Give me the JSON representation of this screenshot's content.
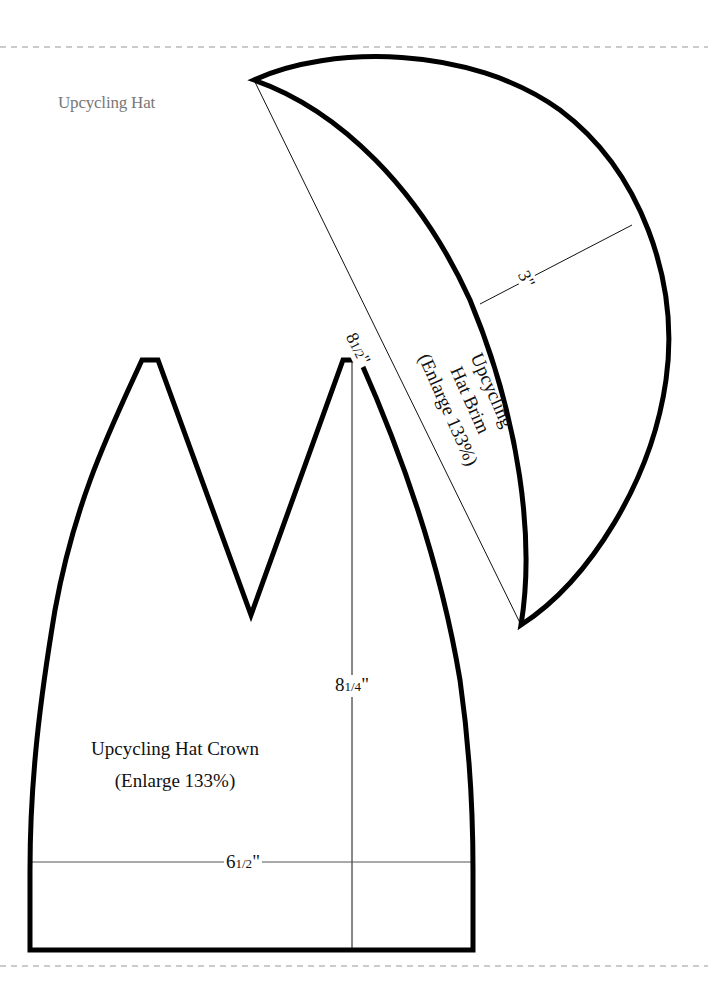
{
  "page": {
    "title": "Upcycling Hat",
    "border_color": "#bbbbbb",
    "outline_color": "#000000",
    "title_color": "#777777"
  },
  "crown": {
    "label_line1": "Upcycling Hat Crown",
    "label_line2": "(Enlarge 133%)",
    "height_dim_whole": "8",
    "height_dim_frac": "1/4",
    "height_dim_unit": "\"",
    "width_dim_whole": "6",
    "width_dim_frac": "1/2",
    "width_dim_unit": "\""
  },
  "brim": {
    "label_line1": "Upcycling",
    "label_line2": "Hat Brim",
    "label_line3": "(Enlarge 133%)",
    "length_dim_whole": "8",
    "length_dim_frac": "1/2",
    "length_dim_unit": "\"",
    "depth_dim": "3\""
  }
}
